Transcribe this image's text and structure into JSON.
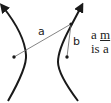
{
  "diagram": {
    "type": "hyperbola-foci-distances",
    "labels": {
      "distance_a": "a",
      "distance_b": "b"
    },
    "side_text": {
      "line1_prefix": "a ",
      "line1_underlined": "m",
      "line2": "is a"
    },
    "colors": {
      "curve": "#1a1a1a",
      "line": "#555555",
      "focus": "#1a1a1a"
    }
  }
}
